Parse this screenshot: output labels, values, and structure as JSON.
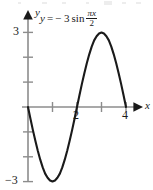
{
  "figure": {
    "name": "sine-curve-figure",
    "width": 153,
    "height": 190,
    "background_color": "#ffffff",
    "equation": {
      "lhs": "y",
      "equals": "=",
      "coefficient": "− 3",
      "function": "sin",
      "fraction_numerator": "πx",
      "fraction_denominator": "2"
    }
  },
  "chart_data": {
    "type": "line",
    "expression": "y = -3*sin(pi*x/2)",
    "amplitude": 3,
    "period": 4,
    "xlabel": "x",
    "ylabel": "y",
    "xlim": [
      -0.25,
      4.7
    ],
    "ylim": [
      -3.4,
      3.4
    ],
    "grid": false,
    "legend": null,
    "axis_color": "#8c8c8c",
    "curve_color": "#1a1a1a",
    "x_ticks": [
      1,
      2,
      3,
      4
    ],
    "x_tick_labels": [
      "",
      "2",
      "",
      "4"
    ],
    "y_ticks": [
      -3,
      -2,
      -1,
      1,
      2,
      3
    ],
    "y_tick_labels": [
      "−3",
      "",
      "",
      "",
      "",
      "3"
    ],
    "key_points": [
      {
        "x": 0,
        "y": 0,
        "kind": "zero-crossing"
      },
      {
        "x": 1,
        "y": -3,
        "kind": "minimum"
      },
      {
        "x": 2,
        "y": 0,
        "kind": "zero-crossing"
      },
      {
        "x": 3,
        "y": 3,
        "kind": "maximum"
      },
      {
        "x": 4,
        "y": 0,
        "kind": "zero-crossing"
      }
    ],
    "x": [
      0,
      0.1,
      0.2,
      0.3,
      0.4,
      0.5,
      0.6,
      0.7,
      0.8,
      0.9,
      1,
      1.1,
      1.2,
      1.3,
      1.4,
      1.5,
      1.6,
      1.7,
      1.8,
      1.9,
      2,
      2.1,
      2.2,
      2.3,
      2.4,
      2.5,
      2.6,
      2.7,
      2.8,
      2.9,
      3,
      3.1,
      3.2,
      3.3,
      3.4,
      3.5,
      3.6,
      3.7,
      3.8,
      3.9,
      4
    ],
    "y": [
      0,
      -0.47,
      -0.93,
      -1.36,
      -1.76,
      -2.12,
      -2.43,
      -2.68,
      -2.85,
      -2.96,
      -3,
      -2.96,
      -2.85,
      -2.68,
      -2.43,
      -2.12,
      -1.76,
      -1.36,
      -0.93,
      -0.47,
      0,
      0.47,
      0.93,
      1.36,
      1.76,
      2.12,
      2.43,
      2.68,
      2.85,
      2.96,
      3,
      2.96,
      2.85,
      2.68,
      2.43,
      2.12,
      1.76,
      1.36,
      0.93,
      0.47,
      0
    ]
  },
  "labels": {
    "axis_y": "y",
    "axis_x": "x",
    "ytick_positive_3": "3",
    "ytick_negative_3": "−3",
    "xtick_2": "2",
    "xtick_4": "4"
  }
}
